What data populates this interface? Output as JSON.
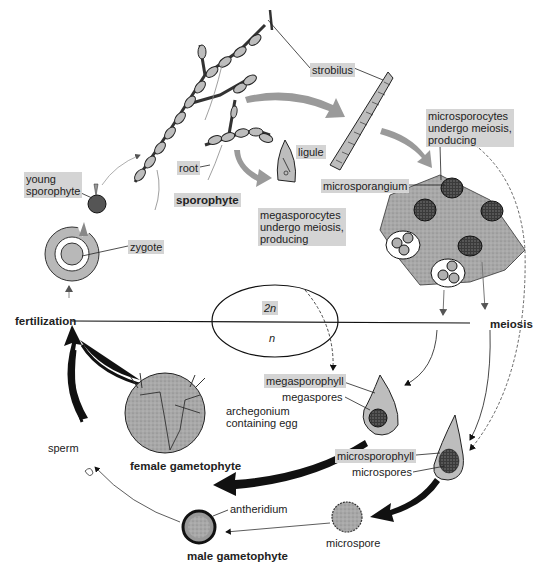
{
  "ploidy": {
    "diploid": "2n",
    "haploid": "n"
  },
  "phases": {
    "sporophyte": "sporophyte",
    "fertilization": "fertilization",
    "meiosis": "meiosis",
    "female_gametophyte": "female gametophyte",
    "male_gametophyte": "male gametophyte"
  },
  "labels": {
    "strobilus": "strobilus",
    "ligule": "ligule",
    "root": "root",
    "young_sporophyte_1": "young",
    "young_sporophyte_2": "sporophyte",
    "zygote": "zygote",
    "microsporocytes_1": "microsporocytes",
    "microsporocytes_2": "undergo meiosis,",
    "microsporocytes_3": "producing",
    "microsporangium": "microsporangium",
    "megasporocytes_1": "megasporocytes",
    "megasporocytes_2": "undergo meiosis,",
    "megasporocytes_3": "producing",
    "megasporophyll": "megasporophyll",
    "megaspores": "megaspores",
    "archegonium_1": "archegonium",
    "archegonium_2": "containing egg",
    "microsporophyll": "microsporophyll",
    "microspores": "microspores",
    "microspore": "microspore",
    "antheridium": "antheridium",
    "sperm": "sperm"
  },
  "colors": {
    "label_box": "#d4d4d4",
    "tissue_gray": "#b8b8b8",
    "arrow_gray": "#9a9a9a",
    "ink": "#1a1a1a"
  }
}
